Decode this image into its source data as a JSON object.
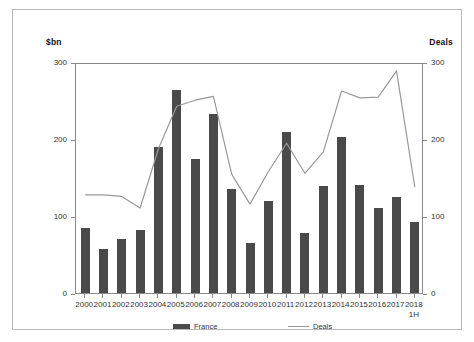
{
  "axis": {
    "left_caption": "$bn",
    "right_caption": "Deals",
    "yticks": [
      "300",
      "200",
      "100",
      "0"
    ],
    "ytick_values": [
      300,
      200,
      100,
      0
    ]
  },
  "legend": {
    "bar_label": "France",
    "line_label": "Deals"
  },
  "xaxis": {
    "last_label_line2": "1H"
  },
  "colors": {
    "bar": "#4a4a4a",
    "line": "#999999",
    "axis": "#8a8a8a",
    "frame": "#b9b9b9",
    "text": "#333333"
  },
  "chart_data": {
    "type": "bar",
    "title": "",
    "subtitle": "",
    "xlabel": "",
    "ylabel": "$bn",
    "y2label": "Deals",
    "ylim": [
      0,
      300
    ],
    "y2lim": [
      0,
      300
    ],
    "yticks": [
      0,
      100,
      200,
      300
    ],
    "y2ticks": [
      0,
      100,
      200,
      300
    ],
    "grid": false,
    "legend_position": "bottom",
    "categories": [
      "2000",
      "2001",
      "2002",
      "2003",
      "2004",
      "2005",
      "2006",
      "2007",
      "2008",
      "2009",
      "2010",
      "2011",
      "2012",
      "2013",
      "2014",
      "2015",
      "2016",
      "2017",
      "2018 1H"
    ],
    "series": [
      {
        "name": "France",
        "type": "bar",
        "axis": "left",
        "unit": "$bn",
        "values": [
          84,
          57,
          70,
          82,
          190,
          264,
          174,
          233,
          135,
          65,
          120,
          209,
          78,
          139,
          203,
          140,
          111,
          125,
          92
        ]
      },
      {
        "name": "Deals",
        "type": "line",
        "axis": "right",
        "unit": "count",
        "values": [
          130,
          130,
          128,
          113,
          190,
          245,
          253,
          258,
          157,
          118,
          160,
          197,
          158,
          186,
          265,
          256,
          257,
          291,
          140
        ]
      }
    ]
  }
}
